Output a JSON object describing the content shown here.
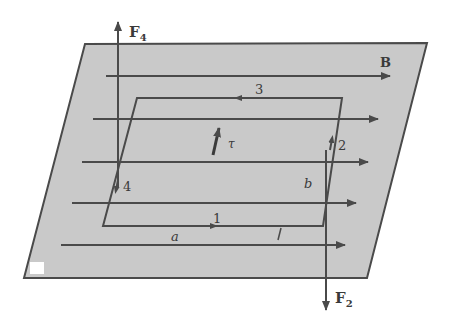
{
  "diagram": {
    "colors": {
      "plane_fill": "#c9c9c9",
      "line": "#4a4a4a",
      "background": "#ffffff"
    },
    "labels": {
      "force_top": "F",
      "force_top_sub": "4",
      "force_bottom": "F",
      "force_bottom_sub": "2",
      "field": "B",
      "torque": "τ",
      "side_1": "1",
      "side_2": "2",
      "side_3": "3",
      "side_4": "4",
      "length_a": "a",
      "length_b": "b",
      "current": "I"
    }
  }
}
